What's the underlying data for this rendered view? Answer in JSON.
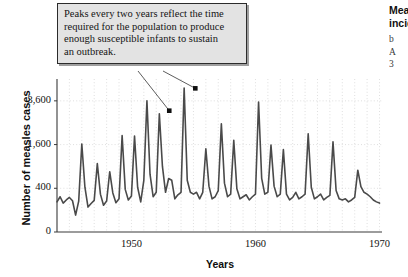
{
  "callout": {
    "text": "Peaks every two years reflect the time\nrequired for the population to produce\nenough susceptible infants to sustain\nan outbreak."
  },
  "side_caption": {
    "title": "Measles\nincidence",
    "body": "b\nA\n3"
  },
  "axes": {
    "y_title": "Number of measles cases",
    "x_title": "Years",
    "y_ticks": [
      "0",
      "400",
      "1,600",
      "3,600"
    ],
    "x_ticks": [
      "1950",
      "1960",
      "1970"
    ]
  },
  "chart_data": {
    "type": "line",
    "title": "",
    "xlabel": "Years",
    "ylabel": "Number of measles cases",
    "xlim": [
      1944.0,
      1970.2
    ],
    "ylim": [
      0,
      4900
    ],
    "y_scale": "sqrt",
    "grid": true,
    "grid_style": "dotted",
    "legend": "none",
    "line_color": "#4a4a4a",
    "line_width": 1.6,
    "y_tick_values": [
      0,
      400,
      1600,
      3600
    ],
    "y_tick_labels": [
      "0",
      "400",
      "1,600",
      "3,600"
    ],
    "x_tick_values": [
      1950,
      1960,
      1970
    ],
    "x_tick_labels": [
      "1950",
      "1960",
      "1970"
    ],
    "annotations": [
      {
        "text": "Peaks every two years reflect the time required for the population to produce enough susceptible infants to sustain an outbreak.",
        "markers": [
          {
            "x": 1953.05,
            "y": 3080
          },
          {
            "x": 1955.15,
            "y": 4320
          }
        ]
      }
    ],
    "series": [
      {
        "name": "Measles cases",
        "x": [
          1944.0,
          1944.25,
          1944.5,
          1944.75,
          1945.0,
          1945.25,
          1945.5,
          1945.75,
          1946.0,
          1946.25,
          1946.5,
          1946.75,
          1947.0,
          1947.25,
          1947.5,
          1947.75,
          1948.0,
          1948.25,
          1948.5,
          1948.75,
          1949.0,
          1949.25,
          1949.5,
          1949.75,
          1950.0,
          1950.25,
          1950.5,
          1950.75,
          1951.0,
          1951.25,
          1951.5,
          1951.75,
          1952.0,
          1952.25,
          1952.5,
          1952.75,
          1953.0,
          1953.25,
          1953.5,
          1953.75,
          1954.0,
          1954.25,
          1954.5,
          1954.75,
          1955.0,
          1955.25,
          1955.5,
          1955.75,
          1956.0,
          1956.25,
          1956.5,
          1956.75,
          1957.0,
          1957.25,
          1957.5,
          1957.75,
          1958.0,
          1958.25,
          1958.5,
          1958.75,
          1959.0,
          1959.25,
          1959.5,
          1959.75,
          1960.0,
          1960.25,
          1960.5,
          1960.75,
          1961.0,
          1961.25,
          1961.5,
          1961.75,
          1962.0,
          1962.25,
          1962.5,
          1962.75,
          1963.0,
          1963.25,
          1963.5,
          1963.75,
          1964.0,
          1964.25,
          1964.5,
          1964.75,
          1965.0,
          1965.25,
          1965.5,
          1965.75,
          1966.0,
          1966.25,
          1966.5,
          1966.75,
          1967.0,
          1967.25,
          1967.5,
          1967.75,
          1968.0,
          1968.25,
          1968.5,
          1968.75,
          1969.0,
          1969.25,
          1969.5,
          1969.75,
          1970.0
        ],
        "values": [
          190,
          260,
          175,
          215,
          250,
          205,
          60,
          200,
          1620,
          420,
          130,
          170,
          210,
          980,
          300,
          150,
          200,
          760,
          320,
          180,
          230,
          1950,
          380,
          215,
          270,
          1930,
          420,
          190,
          560,
          3600,
          700,
          260,
          330,
          2930,
          900,
          330,
          600,
          560,
          230,
          290,
          330,
          4340,
          560,
          330,
          300,
          330,
          230,
          330,
          1450,
          440,
          230,
          260,
          360,
          2450,
          500,
          260,
          300,
          1760,
          390,
          230,
          260,
          290,
          215,
          260,
          300,
          3540,
          600,
          300,
          330,
          1580,
          440,
          260,
          300,
          1420,
          300,
          215,
          250,
          330,
          230,
          260,
          300,
          2020,
          420,
          230,
          260,
          300,
          215,
          250,
          280,
          1700,
          360,
          230,
          215,
          230,
          190,
          215,
          250,
          800,
          430,
          330,
          300,
          260,
          215,
          190,
          175
        ]
      }
    ]
  }
}
